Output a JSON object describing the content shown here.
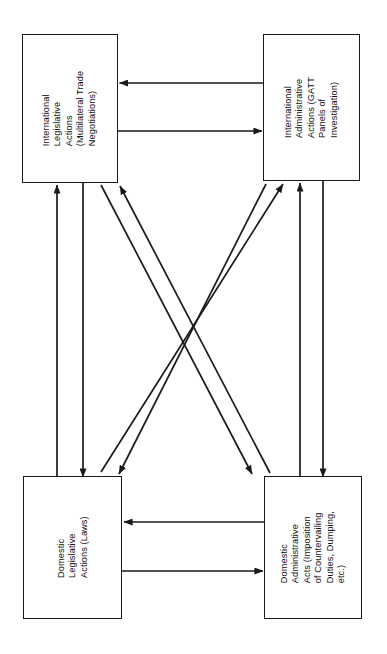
{
  "diagram": {
    "orientation": "landscape-rotated",
    "text_rotation_degrees": -90,
    "background_color": "#ffffff",
    "line_color": "#1a1a1a",
    "nodes": [
      {
        "id": "intl-legislative",
        "position": "top-left",
        "label": "International\nLegislative\nActions\n(Multilateral Trade\nNegotiations)"
      },
      {
        "id": "intl-administrative",
        "position": "top-right",
        "label": "International\nAdministrative\nActions (GATT\nPanels of\nInvestigation)"
      },
      {
        "id": "dom-legislative",
        "position": "bottom-left",
        "label": "Domestic\nLegislative\nActions (Laws)"
      },
      {
        "id": "dom-administrative",
        "position": "bottom-right",
        "label": "Domestic\nAdministrative\nActs (Imposition\nof Countervailing\nDuties, Dumping,\netc.)"
      }
    ],
    "edges": [
      {
        "id": "edge-intl-admin-to-intl-legis",
        "from": "intl-administrative",
        "to": "intl-legislative",
        "kind": "horizontal"
      },
      {
        "id": "edge-intl-legis-to-intl-admin",
        "from": "intl-legislative",
        "to": "intl-administrative",
        "kind": "horizontal"
      },
      {
        "id": "edge-dom-legis-to-intl-legis",
        "from": "dom-legislative",
        "to": "intl-legislative",
        "kind": "vertical"
      },
      {
        "id": "edge-intl-legis-to-dom-legis",
        "from": "intl-legislative",
        "to": "dom-legislative",
        "kind": "vertical"
      },
      {
        "id": "edge-dom-admin-to-intl-admin",
        "from": "dom-administrative",
        "to": "intl-administrative",
        "kind": "vertical"
      },
      {
        "id": "edge-intl-admin-to-dom-admin",
        "from": "intl-administrative",
        "to": "dom-administrative",
        "kind": "vertical"
      },
      {
        "id": "edge-dom-admin-to-intl-legis",
        "from": "dom-administrative",
        "to": "intl-legislative",
        "kind": "diagonal"
      },
      {
        "id": "edge-intl-legis-to-dom-admin",
        "from": "intl-legislative",
        "to": "dom-administrative",
        "kind": "diagonal"
      },
      {
        "id": "edge-intl-admin-to-dom-legis",
        "from": "intl-administrative",
        "to": "dom-legislative",
        "kind": "diagonal"
      },
      {
        "id": "edge-dom-legis-to-intl-admin",
        "from": "dom-legislative",
        "to": "intl-administrative",
        "kind": "diagonal"
      },
      {
        "id": "edge-dom-admin-to-dom-legis",
        "from": "dom-administrative",
        "to": "dom-legislative",
        "kind": "horizontal"
      },
      {
        "id": "edge-dom-legis-to-dom-admin",
        "from": "dom-legislative",
        "to": "dom-administrative",
        "kind": "horizontal"
      }
    ]
  }
}
